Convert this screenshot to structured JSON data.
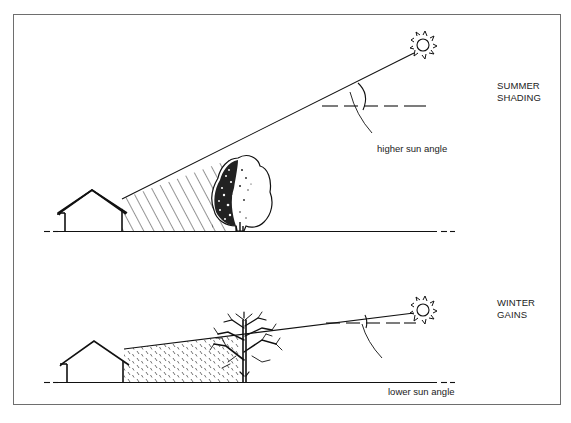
{
  "figure": {
    "border_color": "#6e6e6e",
    "ink_color": "#111111",
    "background": "#ffffff"
  },
  "panels": [
    {
      "id": "summer",
      "title_lines": [
        "SUMMER",
        "SHADING"
      ],
      "angle_label": "higher sun angle",
      "description": "High summer sun; leafy tree casts shade on house"
    },
    {
      "id": "winter",
      "title_lines": [
        "WINTER",
        "GAINS"
      ],
      "angle_label": "lower sun angle",
      "description": "Low winter sun passes through bare tree to reach house"
    }
  ],
  "icons": {
    "sun": "sun-icon",
    "house": "house-icon",
    "leafy_tree": "deciduous-tree-in-leaf-icon",
    "bare_tree": "deciduous-tree-bare-icon"
  }
}
